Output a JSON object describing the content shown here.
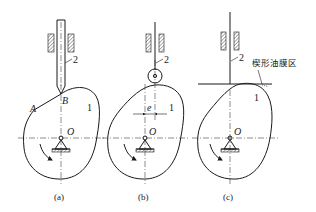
{
  "figure": {
    "panels": [
      {
        "id": "a",
        "caption": "(a)",
        "follower_type": "knife-edge",
        "labels": {
          "part_follower": "2",
          "part_cam": "1",
          "point_A": "A",
          "point_B": "B",
          "center": "O"
        }
      },
      {
        "id": "b",
        "caption": "(b)",
        "follower_type": "roller",
        "labels": {
          "part_follower": "2",
          "part_cam": "1",
          "offset": "e",
          "center": "O"
        }
      },
      {
        "id": "c",
        "caption": "(c)",
        "follower_type": "flat-face",
        "labels": {
          "part_follower": "2",
          "part_cam": "1",
          "center": "O",
          "annotation": "楔形油膜区"
        }
      }
    ],
    "colors": {
      "ink": "#1a1a1a",
      "background": "#ffffff"
    }
  }
}
